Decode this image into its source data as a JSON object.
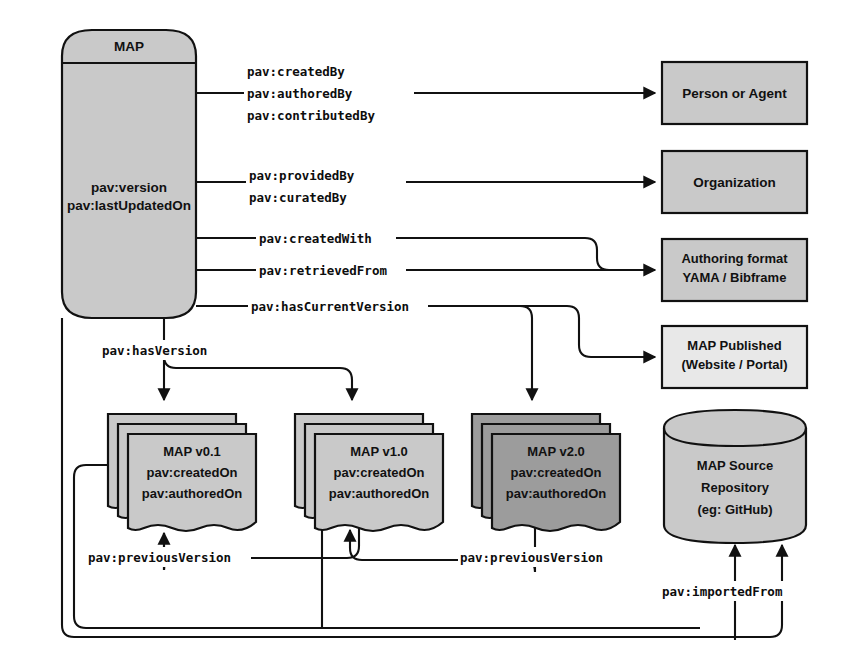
{
  "diagram": {
    "colors": {
      "fill_light": "#c9c9c9",
      "fill_dark": "#9c9c9c",
      "stroke": "#111111",
      "background": "#ffffff"
    },
    "main_node": {
      "header_label": "MAP",
      "body_lines": [
        "pav:version",
        "pav:lastUpdatedOn"
      ]
    },
    "right_nodes": [
      {
        "id": "person-or-agent",
        "lines": [
          "Person or Agent"
        ],
        "shape": "rect",
        "fill": "light"
      },
      {
        "id": "organization",
        "lines": [
          "Organization"
        ],
        "shape": "rect",
        "fill": "light"
      },
      {
        "id": "authoring-format",
        "lines": [
          "Authoring format",
          "YAMA / Bibframe"
        ],
        "shape": "rect",
        "fill": "light"
      },
      {
        "id": "map-published",
        "lines": [
          "MAP Published",
          "(Website / Portal)"
        ],
        "shape": "rect",
        "fill": "light"
      },
      {
        "id": "map-source-repository",
        "lines": [
          "MAP Source",
          "Repository",
          "(eg: GitHub)"
        ],
        "shape": "cylinder",
        "fill": "light"
      }
    ],
    "version_nodes": [
      {
        "id": "map-v0-1",
        "lines": [
          "MAP v0.1",
          "pav:createdOn",
          "pav:authoredOn"
        ],
        "shape": "document-stack",
        "fill": "light"
      },
      {
        "id": "map-v1-0",
        "lines": [
          "MAP v1.0",
          "pav:createdOn",
          "pav:authoredOn"
        ],
        "shape": "document-stack",
        "fill": "light"
      },
      {
        "id": "map-v2-0",
        "lines": [
          "MAP v2.0",
          "pav:createdOn",
          "pav:authoredOn"
        ],
        "shape": "document-stack",
        "fill": "dark"
      }
    ],
    "edge_labels": {
      "created_by": "pav:createdBy",
      "authored_by": "pav:authoredBy",
      "contributed_by": "pav:contributedBy",
      "provided_by": "pav:providedBy",
      "curated_by": "pav:curatedBy",
      "created_with": "pav:createdWith",
      "retrieved_from": "pav:retrievedFrom",
      "has_current_version": "pav:hasCurrentVersion",
      "has_version": "pav:hasVersion",
      "previous_version_1": "pav:previousVersion",
      "previous_version_2": "pav:previousVersion",
      "imported_from": "pav:importedFrom"
    }
  }
}
